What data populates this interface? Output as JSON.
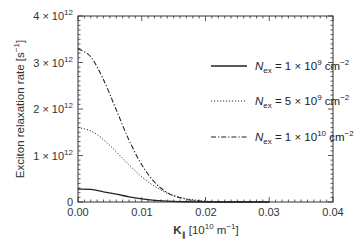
{
  "chart_data": {
    "type": "line",
    "title": "",
    "xlabel": "K∥ [10^10 m^-1]",
    "ylabel": "Exciton relaxation rate [s^-1]",
    "xlim": [
      0.0,
      0.04
    ],
    "ylim": [
      0,
      4000000000000.0
    ],
    "grid": false,
    "legend_position": "upper right",
    "x_ticks": [
      "0.00",
      "0.01",
      "0.02",
      "0.03",
      "0.04"
    ],
    "y_ticks": [
      "0",
      "1 × 10^12",
      "2 × 10^12",
      "3 × 10^12",
      "4 × 10^12"
    ],
    "x": [
      0.0,
      0.002,
      0.004,
      0.006,
      0.008,
      0.01,
      0.012,
      0.014,
      0.016,
      0.018,
      0.02,
      0.022,
      0.024
    ],
    "series": [
      {
        "name": "N_ex = 1 × 10^9 cm^-2",
        "style": "solid",
        "values": [
          280000000000.0,
          270000000000.0,
          220000000000.0,
          170000000000.0,
          110000000000.0,
          68000000000.0,
          37000000000.0,
          18000000000.0,
          8000000000.0,
          3000000000.0,
          1000000000.0,
          0.0,
          0.0
        ]
      },
      {
        "name": "N_ex = 5 × 10^9 cm^-2",
        "style": "dotted",
        "values": [
          1600000000000.0,
          1530000000000.0,
          1340000000000.0,
          1080000000000.0,
          800000000000.0,
          540000000000.0,
          340000000000.0,
          190000000000.0,
          100000000000.0,
          50000000000.0,
          20000000000.0,
          8000000000.0,
          3000000000.0
        ]
      },
      {
        "name": "N_ex = 1 × 10^10 cm^-2",
        "style": "dash-dot",
        "values": [
          3300000000000.0,
          3120000000000.0,
          2630000000000.0,
          1980000000000.0,
          1330000000000.0,
          800000000000.0,
          430000000000.0,
          200000000000.0,
          90000000000.0,
          35000000000.0,
          12000000000.0,
          4000000000.0,
          1000000000.0
        ]
      }
    ]
  },
  "axes": {
    "xlabel_main": "K",
    "xlabel_sub": "∥",
    "xlabel_unit": " [10",
    "xlabel_exp": "10",
    "xlabel_unit2": " m",
    "xlabel_exp2": "−1",
    "xlabel_close": "]",
    "ylabel": "Exciton relaxation rate [s",
    "ylabel_exp": "−1",
    "ylabel_close": "]",
    "yticks": [
      {
        "mant": "0",
        "exp": ""
      },
      {
        "mant": "1 × 10",
        "exp": "12"
      },
      {
        "mant": "2 × 10",
        "exp": "12"
      },
      {
        "mant": "3 × 10",
        "exp": "12"
      },
      {
        "mant": "4 × 10",
        "exp": "12"
      }
    ],
    "xticks": [
      "0.00",
      "0.01",
      "0.02",
      "0.03",
      "0.04"
    ]
  },
  "legend": [
    {
      "n": "N",
      "sub": "ex",
      "eq": " = 1 × 10",
      "exp": "9",
      "unit": " cm",
      "uexp": "−2"
    },
    {
      "n": "N",
      "sub": "ex",
      "eq": " = 5 × 10",
      "exp": "9",
      "unit": " cm",
      "uexp": "−2"
    },
    {
      "n": "N",
      "sub": "ex",
      "eq": " = 1 × 10",
      "exp": "10",
      "unit": " cm",
      "uexp": "−2"
    }
  ]
}
